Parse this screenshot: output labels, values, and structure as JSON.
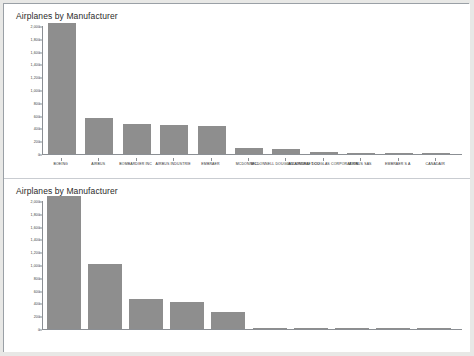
{
  "page": {
    "background_color": "#e8e8e6",
    "panel_color": "#ffffff",
    "border_color": "#9aa0a6",
    "bar_color": "#8e8e8e",
    "axis_color": "#8b8f94"
  },
  "charts": [
    {
      "id": "chart-top",
      "title": "Airplanes by Manufacturer"
    },
    {
      "id": "chart-bottom",
      "title": "Airplanes by Manufacturer"
    }
  ],
  "chart_data": [
    {
      "type": "bar",
      "title": "Airplanes by Manufacturer",
      "xlabel": "",
      "ylabel": "",
      "ylim": [
        0,
        2000
      ],
      "grid": false,
      "legend": "none",
      "yticks": [
        0,
        200,
        400,
        600,
        800,
        1000,
        1200,
        1400,
        1600,
        1800,
        2000
      ],
      "ytick_labels": [
        "0",
        "200",
        "400",
        "600",
        "800",
        "1,000",
        "1,200",
        "1,400",
        "1,600",
        "1,800",
        "2,000"
      ],
      "categories": [
        "BOEING",
        "AIRBUS",
        "BOMBARDIER INC",
        "AIRBUS INDUSTRIE",
        "EMBRAER",
        "MCDONNEL...",
        "MCDONNELL DOUGLAS AIRCRAFT CO",
        "MCDONNELL DOUGLAS CORPORATION",
        "AIRBUS SAS",
        "EMBRAER S A",
        "CANADAIR"
      ],
      "values": [
        2050,
        560,
        470,
        460,
        430,
        90,
        80,
        25,
        15,
        10,
        5
      ]
    },
    {
      "type": "bar",
      "title": "Airplanes by Manufacturer",
      "xlabel": "",
      "ylabel": "",
      "ylim": [
        0,
        2000
      ],
      "grid": false,
      "legend": "none",
      "yticks": [
        0,
        200,
        400,
        600,
        800,
        1000,
        1200,
        1400,
        1600,
        1800,
        2000
      ],
      "ytick_labels": [
        "0",
        "200",
        "400",
        "600",
        "800",
        "1,000",
        "1,200",
        "1,400",
        "1,600",
        "1,800",
        "2,000"
      ],
      "categories": [
        "BOEING",
        "AIRBUS",
        "BOMBARDIER INC",
        "EMBRAER",
        "MCDONNELL DOUG...",
        "CANADAIR",
        "CESSNA",
        "PIPER",
        "GULFSTREAM AER...",
        "BEECH"
      ],
      "values": [
        2080,
        1010,
        470,
        420,
        260,
        6,
        4,
        3,
        2,
        2
      ]
    }
  ]
}
